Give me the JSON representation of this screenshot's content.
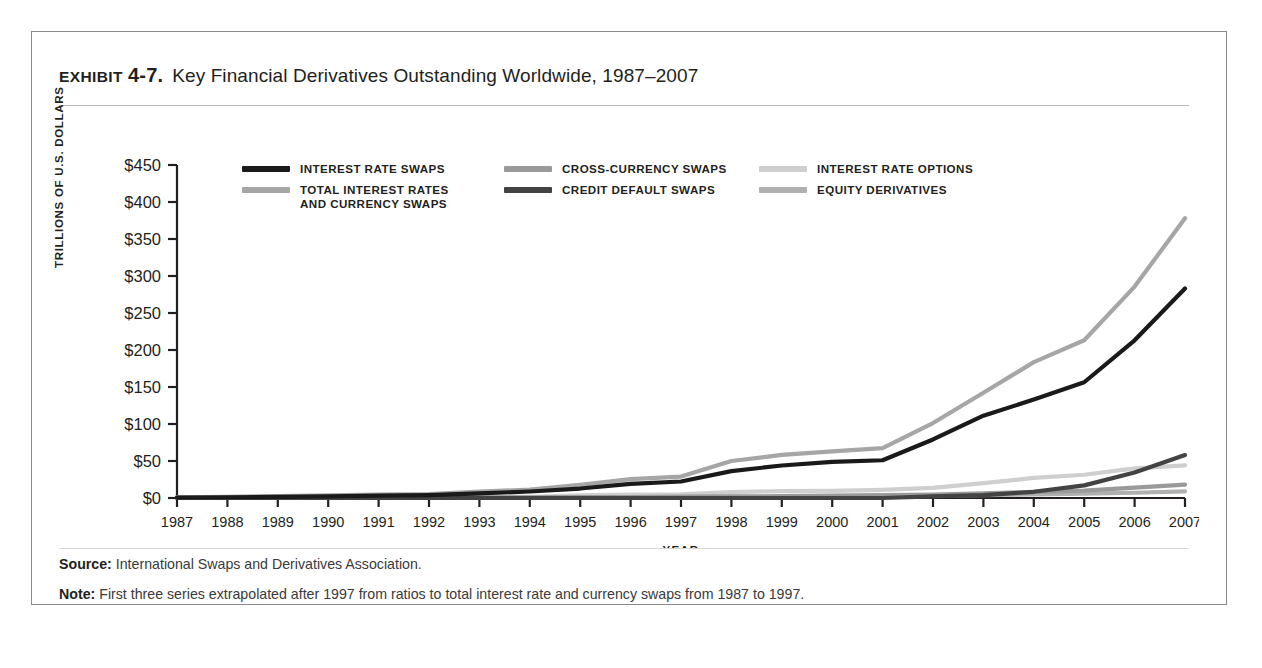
{
  "exhibit": {
    "kicker": "EXHIBIT",
    "number": "4-7.",
    "title": "Key Financial Derivatives Outstanding Worldwide, 1987–2007"
  },
  "footnotes": {
    "source_label": "Source:",
    "source_text": "International Swaps and Derivatives Association.",
    "note_label": "Note:",
    "note_text": "First three series extrapolated after 1997 from ratios to total interest rate and currency swaps from 1987 to 1997."
  },
  "legend": {
    "columns": [
      [
        {
          "label": "INTEREST RATE SWAPS",
          "color": "#1a1a1a"
        },
        {
          "label": "TOTAL INTEREST RATES\nAND CURRENCY SWAPS",
          "color": "#a6a6a6"
        }
      ],
      [
        {
          "label": "CROSS-CURRENCY SWAPS",
          "color": "#9a9a9a"
        },
        {
          "label": "CREDIT DEFAULT SWAPS",
          "color": "#434343"
        }
      ],
      [
        {
          "label": "INTEREST RATE OPTIONS",
          "color": "#cfcfcf"
        },
        {
          "label": "EQUITY DERIVATIVES",
          "color": "#b0b0b0"
        }
      ]
    ]
  },
  "chart_data": {
    "type": "line",
    "title": "Key Financial Derivatives Outstanding Worldwide, 1987–2007",
    "xlabel": "YEAR",
    "ylabel": "TRILLIONS OF U.S. DOLLARS",
    "ylim": [
      0,
      450
    ],
    "yticks": [
      0,
      50,
      100,
      150,
      200,
      250,
      300,
      350,
      400,
      450
    ],
    "ytick_labels": [
      "$0",
      "$50",
      "$100",
      "$150",
      "$200",
      "$250",
      "$300",
      "$350",
      "$400",
      "$450"
    ],
    "grid": false,
    "legend_position": "top-inside",
    "categories": [
      1987,
      1988,
      1989,
      1990,
      1991,
      1992,
      1993,
      1994,
      1995,
      1996,
      1997,
      1998,
      1999,
      2000,
      2001,
      2002,
      2003,
      2004,
      2005,
      2006,
      2007
    ],
    "xtick_labels": [
      "1987",
      "1988",
      "1989",
      "1990",
      "1991",
      "1992",
      "1993",
      "1994",
      "1995",
      "1996",
      "1997",
      "1998",
      "1999",
      "2000",
      "2001",
      "2002",
      "2003",
      "2004",
      "2005",
      "2006",
      "2007"
    ],
    "series": [
      {
        "name": "INTEREST RATE SWAPS",
        "color": "#1a1a1a",
        "width": 4.2,
        "values": [
          0.7,
          1.0,
          1.5,
          2.3,
          3.1,
          3.9,
          6.2,
          8.8,
          12.8,
          19.2,
          22.3,
          36.3,
          43.9,
          48.8,
          51.0,
          79.1,
          111.2,
          133.0,
          156.4,
          213.1,
          283.0
        ]
      },
      {
        "name": "TOTAL INTEREST RATES AND CURRENCY SWAPS",
        "color": "#a6a6a6",
        "width": 4.2,
        "values": [
          1.0,
          1.6,
          2.5,
          3.5,
          4.5,
          5.3,
          8.5,
          11.3,
          17.7,
          25.5,
          29.0,
          50.0,
          58.3,
          63.0,
          67.5,
          101.3,
          142.3,
          183.6,
          213.2,
          285.7,
          378.0
        ]
      },
      {
        "name": "CROSS-CURRENCY SWAPS",
        "color": "#9a9a9a",
        "width": 4.2,
        "values": [
          0.3,
          0.5,
          0.6,
          0.8,
          0.8,
          0.9,
          0.9,
          0.9,
          1.2,
          1.3,
          1.8,
          2.3,
          2.4,
          3.2,
          3.9,
          4.5,
          6.4,
          8.2,
          10.0,
          14.0,
          18.0
        ]
      },
      {
        "name": "CREDIT DEFAULT SWAPS",
        "color": "#434343",
        "width": 4.2,
        "values": [
          0,
          0,
          0,
          0,
          0,
          0,
          0,
          0,
          0,
          0,
          0,
          0,
          0,
          0,
          0,
          2.2,
          3.8,
          8.4,
          17.1,
          34.4,
          58.0
        ]
      },
      {
        "name": "INTEREST RATE OPTIONS",
        "color": "#cfcfcf",
        "width": 4.2,
        "values": [
          0.3,
          0.4,
          0.5,
          0.6,
          0.6,
          0.6,
          1.4,
          1.6,
          3.7,
          4.7,
          4.9,
          7.9,
          9.4,
          9.5,
          10.9,
          13.7,
          20.0,
          27.1,
          31.4,
          40.0,
          44.0
        ]
      },
      {
        "name": "EQUITY DERIVATIVES",
        "color": "#b0b0b0",
        "width": 4.2,
        "values": [
          0.1,
          0.1,
          0.2,
          0.2,
          0.2,
          0.2,
          0.2,
          0.3,
          0.6,
          0.8,
          0.9,
          1.5,
          1.8,
          2.0,
          2.3,
          2.8,
          3.8,
          4.7,
          5.8,
          7.1,
          9.0
        ]
      }
    ]
  }
}
